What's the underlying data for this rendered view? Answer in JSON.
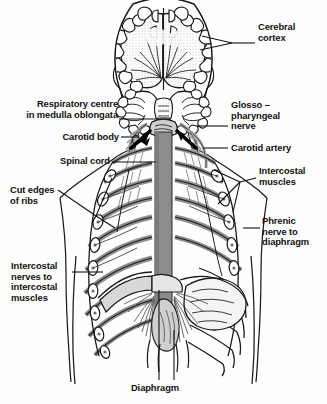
{
  "figure": {
    "type": "anatomical-line-diagram",
    "orientation": "coronal / anterior view of head, neck and thorax"
  },
  "colors": {
    "background": "#fefefe",
    "ink": "#111111",
    "line": "#1a1a1a",
    "cord_grey": "#8c8c8c",
    "rib_grey": "#9a9a9a",
    "tissue_grey": "#bdbdbd",
    "stipple_grey": "#c9c9c9",
    "diaphragm_grey": "#d3d3d3"
  },
  "labels": [
    {
      "id": "cerebral-cortex",
      "name": "label-cerebral-cortex",
      "lines": [
        "Cerebral",
        "cortex"
      ],
      "align": "left",
      "x": 258,
      "y": 22,
      "leader": "two-pronged fork pointing left into the cerebral hemispheres"
    },
    {
      "id": "respiratory-centre",
      "name": "label-respiratory-centre",
      "lines": [
        "Respiratory centre",
        "in medulla oblongata"
      ],
      "align": "right",
      "x": 14,
      "y": 99,
      "leader": "horizontal line to medulla oblongata"
    },
    {
      "id": "glossopharyngeal-nerve",
      "name": "label-glossopharyngeal-nerve",
      "lines": [
        "Glosso –",
        "pharyngeal",
        "nerve"
      ],
      "align": "left",
      "x": 230,
      "y": 102,
      "leader": "horizontal line to glossopharyngeal nerve"
    },
    {
      "id": "carotid-body",
      "name": "label-carotid-body",
      "lines": [
        "Carotid body"
      ],
      "align": "right",
      "x": 58,
      "y": 133,
      "leader": "horizontal line to carotid body"
    },
    {
      "id": "carotid-artery",
      "name": "label-carotid-artery",
      "lines": [
        "Carotid artery"
      ],
      "align": "left",
      "x": 230,
      "y": 143,
      "leader": "horizontal line to carotid artery"
    },
    {
      "id": "spinal-cord",
      "name": "label-spinal-cord",
      "lines": [
        "Spinal cord"
      ],
      "align": "right",
      "x": 54,
      "y": 157,
      "leader": "horizontal line to spinal cord"
    },
    {
      "id": "intercostal-muscles",
      "name": "label-intercostal-muscles",
      "lines": [
        "Intercostal",
        "muscles"
      ],
      "align": "left",
      "x": 258,
      "y": 167,
      "leader": "three-pronged fork pointing left to intercostal muscles"
    },
    {
      "id": "cut-edges-of-ribs",
      "name": "label-cut-edges-of-ribs",
      "lines": [
        "Cut edges",
        "of ribs"
      ],
      "align": "left",
      "x": 10,
      "y": 187,
      "leader": "forked line to cut rib ends"
    },
    {
      "id": "phrenic-nerve",
      "name": "label-phrenic-nerve",
      "lines": [
        "Phrenic",
        "nerve to",
        "diaphragm"
      ],
      "align": "left",
      "x": 262,
      "y": 218,
      "leader": "short line to phrenic nerve"
    },
    {
      "id": "intercostal-nerves",
      "name": "label-intercostal-nerves",
      "lines": [
        "Intercostal",
        "nerves to",
        "intercostal",
        "muscles"
      ],
      "align": "left",
      "x": 12,
      "y": 262,
      "leader": "horizontal line to intercostal nerve"
    },
    {
      "id": "diaphragm",
      "name": "label-diaphragm",
      "lines": [
        "Diaphragm"
      ],
      "align": "center",
      "x": 132,
      "y": 386,
      "leader": "vertical line up to diaphragm"
    }
  ],
  "structures": [
    {
      "name": "cerebral-cortex",
      "note": "folded gyri and sulci of both hemispheres, stippled grey matter"
    },
    {
      "name": "cerebellum",
      "note": "two coiled cerebellar hemispheres below the cortex"
    },
    {
      "name": "medulla-oblongata",
      "note": "respiratory centre at the brainstem, marked by two bold converging arrows"
    },
    {
      "name": "spinal-cord",
      "note": "broad vertical grey band descending through the thorax"
    },
    {
      "name": "carotid-body",
      "note": "small receptor at the carotid bifurcation, left side"
    },
    {
      "name": "carotid-artery",
      "note": "vessel ascending the right side of the neck"
    },
    {
      "name": "glossopharyngeal-nerve",
      "note": "nerve branching in the right neck"
    },
    {
      "name": "rib-cage",
      "note": "grey filled ribs on the left hemithorax, white outlined ribs on the right"
    },
    {
      "name": "intercostal-nerves",
      "note": "segmental nerves at each cut rib end"
    },
    {
      "name": "phrenic-nerve",
      "note": "long nerve descending to the diaphragm"
    },
    {
      "name": "diaphragm",
      "note": "radiating muscle fibres converging on a central tendon"
    }
  ],
  "arrows": [
    {
      "name": "afferent-arrow-left",
      "note": "bold black arrow pointing up-right into the medulla"
    },
    {
      "name": "afferent-arrow-right",
      "note": "bold black arrow pointing up-left into the medulla"
    }
  ]
}
